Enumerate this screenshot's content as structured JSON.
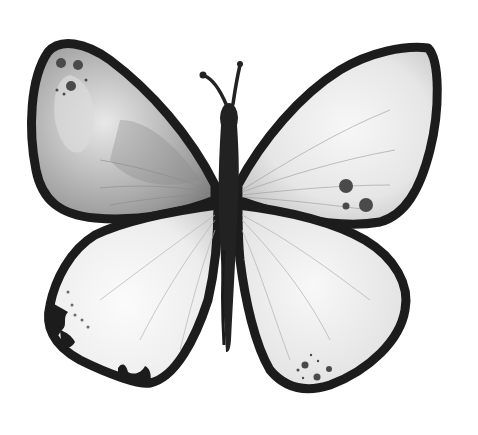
{
  "image": {
    "subject": "butterfly illustration",
    "style": "grayscale ink and watercolor sketch",
    "background": "#ffffff"
  },
  "colors": {
    "outline": "#1c1c1c",
    "body": "#222222",
    "wing_light": "#f2f2f2",
    "wing_mid": "#c9c9c9",
    "wing_dark": "#8f8f8f",
    "spot": "#4a4a4a"
  },
  "parts": {
    "left_forewing": "upper left wing with dark mottled shading and three spots near tip",
    "right_forewing": "upper right wing, light with three dark spots near lower edge",
    "left_hindwing": "lower left wing with scalloped dark marginal pattern",
    "right_hindwing": "lower right wing with dotted cluster near bottom",
    "body": "dark elongated thorax and abdomen",
    "antennae": "two curled antennae"
  }
}
